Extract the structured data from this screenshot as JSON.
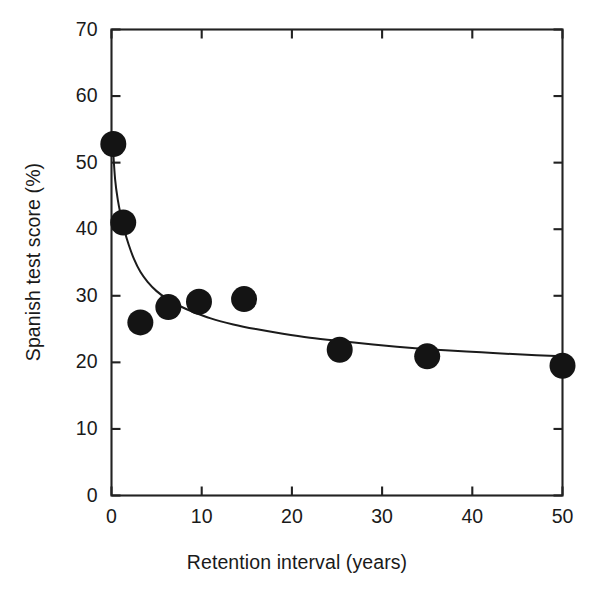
{
  "chart_data": {
    "type": "scatter",
    "title": "",
    "subtitle": "",
    "xlabel": "Retention interval (years)",
    "ylabel": "Spanish test score (%)",
    "xlim": [
      0,
      50
    ],
    "ylim": [
      0,
      70
    ],
    "xticks": [
      0,
      10,
      20,
      30,
      40,
      50
    ],
    "yticks": [
      0,
      10,
      20,
      30,
      40,
      50,
      60,
      70
    ],
    "xtick_labels": [
      "0",
      "10",
      "20",
      "30",
      "40",
      "50"
    ],
    "ytick_labels": [
      "0",
      "10",
      "20",
      "30",
      "40",
      "50",
      "60",
      "70"
    ],
    "grid": false,
    "legend": null,
    "legend_position": "none",
    "marker": {
      "shape": "circle",
      "color": "#141414",
      "radius_px": 13
    },
    "series": [
      {
        "name": "Observed mean scores",
        "type": "scatter",
        "x": [
          0.2,
          1.3,
          3.2,
          6.3,
          9.7,
          14.7,
          25.3,
          35.0,
          50.0
        ],
        "y": [
          52.8,
          41.0,
          26.0,
          28.3,
          29.1,
          29.5,
          21.9,
          20.9,
          19.5
        ]
      },
      {
        "name": "Fitted retention curve",
        "type": "line",
        "x": [
          0.15,
          0.4,
          0.7,
          1.0,
          1.4,
          1.9,
          2.5,
          3.2,
          4.0,
          5.0,
          6.3,
          7.5,
          9.0,
          11.0,
          13.5,
          16.0,
          19.0,
          22.0,
          25.3,
          29.0,
          33.0,
          37.0,
          41.0,
          45.0,
          50.0
        ],
        "y": [
          52.4,
          47.5,
          44.4,
          42.3,
          40.0,
          37.7,
          35.5,
          33.6,
          32.1,
          30.7,
          29.4,
          28.5,
          27.6,
          26.6,
          25.7,
          25.0,
          24.3,
          23.7,
          23.2,
          22.7,
          22.2,
          21.8,
          21.5,
          21.2,
          20.9
        ]
      }
    ],
    "colors": {
      "marker": "#141414",
      "curve": "#1b1b1b",
      "axis": "#222222",
      "background": "#ffffff"
    }
  },
  "axes": {
    "x_title": "Retention interval (years)",
    "y_title": "Spanish test score (%)"
  }
}
